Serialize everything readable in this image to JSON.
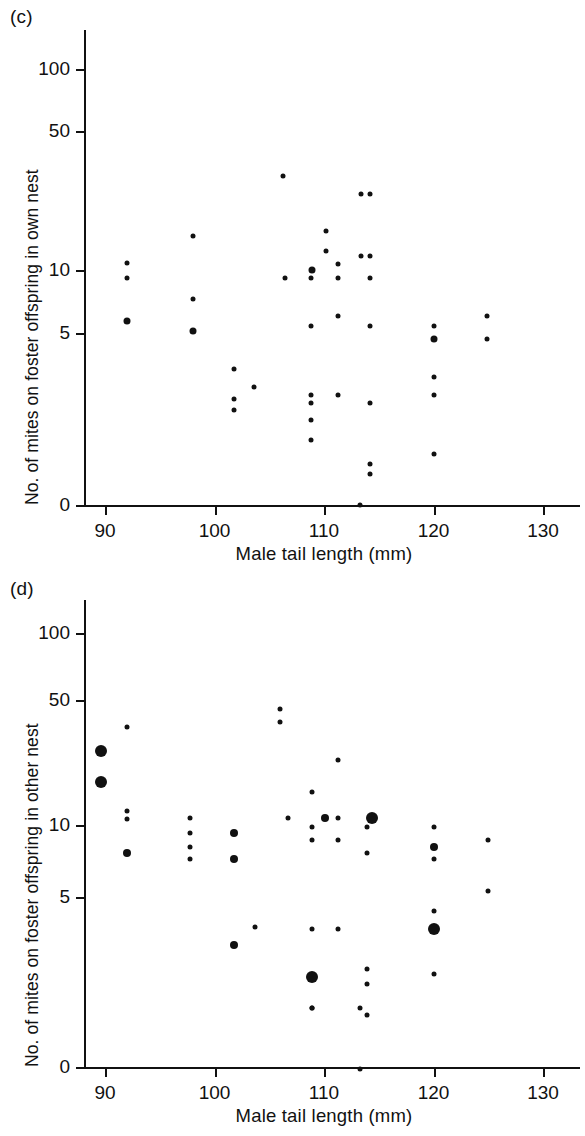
{
  "figure": {
    "background": "#ffffff",
    "ink": "#111111"
  },
  "panels": [
    {
      "id": "c",
      "label": "(c)",
      "xlabel": "Male tail length  (mm)",
      "ylabel": "No. of mites on foster offspring in own nest"
    },
    {
      "id": "d",
      "label": "(d)",
      "xlabel": "Male tail length  (mm)",
      "ylabel": "No. of mites on foster offspring in other nest"
    }
  ],
  "chart_data": [
    {
      "type": "scatter",
      "panel": "(c)",
      "title": "No. of mites on foster offspring in own nest vs male tail length",
      "xlabel": "Male tail length  (mm)",
      "ylabel": "No. of mites on foster offspring in own nest",
      "xlim": [
        88.6,
        131.5
      ],
      "xticks": [
        90,
        100,
        110,
        120,
        130
      ],
      "xticklabels": [
        "90",
        "100",
        "110",
        "120",
        "130"
      ],
      "yscale": "log-with-zero-break",
      "yticks": [
        100,
        50,
        10,
        5,
        0
      ],
      "yticklabels": [
        "100",
        "50",
        "10",
        "5",
        "0"
      ],
      "grid": false,
      "legend": null,
      "marker": "filled circle",
      "marker_sizes_px": {
        "small": 5,
        "medium": 7,
        "large": 9
      },
      "points": [
        {
          "x": 92.0,
          "y": 18,
          "size": "medium"
        },
        {
          "x": 92.0,
          "y": 11,
          "size": "small"
        },
        {
          "x": 92.0,
          "y": 9.2,
          "size": "small"
        },
        {
          "x": 98.0,
          "y": 20,
          "size": "medium"
        },
        {
          "x": 98.0,
          "y": 14,
          "size": "small"
        },
        {
          "x": 98.0,
          "y": 6.8,
          "size": "small"
        },
        {
          "x": 101.8,
          "y": 50,
          "size": "small"
        },
        {
          "x": 101.8,
          "y": 44,
          "size": "small"
        },
        {
          "x": 101.8,
          "y": 31,
          "size": "small"
        },
        {
          "x": 103.6,
          "y": 38,
          "size": "small"
        },
        {
          "x": 106.4,
          "y": 11,
          "size": "small"
        },
        {
          "x": 106.3,
          "y": 3.4,
          "size": "small"
        },
        {
          "x": 108.8,
          "y": 70,
          "size": "small"
        },
        {
          "x": 108.8,
          "y": 56,
          "size": "small"
        },
        {
          "x": 108.8,
          "y": 46,
          "size": "small"
        },
        {
          "x": 108.8,
          "y": 42,
          "size": "small"
        },
        {
          "x": 108.8,
          "y": 19,
          "size": "small"
        },
        {
          "x": 108.8,
          "y": 11,
          "size": "small"
        },
        {
          "x": 108.9,
          "y": 10,
          "size": "medium"
        },
        {
          "x": 110.2,
          "y": 8.0,
          "size": "small"
        },
        {
          "x": 110.2,
          "y": 6.4,
          "size": "small"
        },
        {
          "x": 111.3,
          "y": 42,
          "size": "small"
        },
        {
          "x": 111.3,
          "y": 17,
          "size": "small"
        },
        {
          "x": 111.3,
          "y": 11,
          "size": "small"
        },
        {
          "x": 111.3,
          "y": 9.3,
          "size": "small"
        },
        {
          "x": 113.3,
          "y": 0,
          "size": "small"
        },
        {
          "x": 113.4,
          "y": 8.5,
          "size": "small"
        },
        {
          "x": 113.4,
          "y": 4.2,
          "size": "small"
        },
        {
          "x": 114.2,
          "y": 104,
          "size": "small"
        },
        {
          "x": 114.2,
          "y": 92,
          "size": "small"
        },
        {
          "x": 114.2,
          "y": 46,
          "size": "small"
        },
        {
          "x": 114.2,
          "y": 19,
          "size": "small"
        },
        {
          "x": 114.2,
          "y": 11,
          "size": "small"
        },
        {
          "x": 114.2,
          "y": 8.5,
          "size": "small"
        },
        {
          "x": 114.2,
          "y": 4.2,
          "size": "small"
        },
        {
          "x": 120.0,
          "y": 82,
          "size": "small"
        },
        {
          "x": 120.0,
          "y": 42,
          "size": "small"
        },
        {
          "x": 120.0,
          "y": 34,
          "size": "small"
        },
        {
          "x": 120.0,
          "y": 22,
          "size": "medium"
        },
        {
          "x": 120.0,
          "y": 19,
          "size": "small"
        },
        {
          "x": 124.9,
          "y": 22,
          "size": "small"
        },
        {
          "x": 124.9,
          "y": 17,
          "size": "small"
        }
      ]
    },
    {
      "type": "scatter",
      "panel": "(d)",
      "title": "No. of mites on foster offspring in other nest vs male tail length",
      "xlabel": "Male tail length  (mm)",
      "ylabel": "No. of mites on foster offspring in other nest",
      "xlim": [
        88.6,
        131.5
      ],
      "xticks": [
        90,
        100,
        110,
        120,
        130
      ],
      "xticklabels": [
        "90",
        "100",
        "110",
        "120",
        "130"
      ],
      "yscale": "log-with-zero-break",
      "yticks": [
        100,
        50,
        10,
        5,
        0
      ],
      "yticklabels": [
        "100",
        "50",
        "10",
        "5",
        "0"
      ],
      "grid": false,
      "legend": null,
      "marker": "filled circle",
      "marker_sizes_px": {
        "small": 5,
        "medium": 8,
        "large": 12
      },
      "points": [
        {
          "x": 89.6,
          "y": 4.1,
          "size": "large"
        },
        {
          "x": 89.6,
          "y": 1.7,
          "size": "large"
        },
        {
          "x": 92.0,
          "y": 14,
          "size": "medium"
        },
        {
          "x": 92.0,
          "y": 9.3,
          "size": "small"
        },
        {
          "x": 92.0,
          "y": 8.5,
          "size": "small"
        },
        {
          "x": 92.0,
          "y": 3.1,
          "size": "small"
        },
        {
          "x": 97.8,
          "y": 15,
          "size": "small"
        },
        {
          "x": 97.8,
          "y": 13,
          "size": "small"
        },
        {
          "x": 97.8,
          "y": 11,
          "size": "small"
        },
        {
          "x": 97.8,
          "y": 9.2,
          "size": "small"
        },
        {
          "x": 101.8,
          "y": 42,
          "size": "medium"
        },
        {
          "x": 101.8,
          "y": 15,
          "size": "medium"
        },
        {
          "x": 101.8,
          "y": 11,
          "size": "medium"
        },
        {
          "x": 103.7,
          "y": 34,
          "size": "small"
        },
        {
          "x": 106.0,
          "y": 2.9,
          "size": "small"
        },
        {
          "x": 106.0,
          "y": 2.5,
          "size": "small"
        },
        {
          "x": 106.7,
          "y": 9.2,
          "size": "small"
        },
        {
          "x": 108.9,
          "y": 90,
          "size": "small"
        },
        {
          "x": 108.9,
          "y": 62,
          "size": "large"
        },
        {
          "x": 108.9,
          "y": 35,
          "size": "small"
        },
        {
          "x": 108.9,
          "y": 12,
          "size": "small"
        },
        {
          "x": 108.9,
          "y": 10.3,
          "size": "small"
        },
        {
          "x": 108.9,
          "y": 6.7,
          "size": "small"
        },
        {
          "x": 108.9,
          "y": 0.35,
          "size": "small"
        },
        {
          "x": 110.1,
          "y": 9.2,
          "size": "medium"
        },
        {
          "x": 111.3,
          "y": 35,
          "size": "small"
        },
        {
          "x": 111.3,
          "y": 12,
          "size": "small"
        },
        {
          "x": 111.3,
          "y": 9.2,
          "size": "small"
        },
        {
          "x": 111.3,
          "y": 4.6,
          "size": "small"
        },
        {
          "x": 113.3,
          "y": 0.35,
          "size": "small"
        },
        {
          "x": 113.3,
          "y": -0.2,
          "size": "small"
        },
        {
          "x": 113.9,
          "y": 98,
          "size": "small"
        },
        {
          "x": 113.9,
          "y": 67,
          "size": "small"
        },
        {
          "x": 113.9,
          "y": 56,
          "size": "small"
        },
        {
          "x": 113.9,
          "y": 14,
          "size": "small"
        },
        {
          "x": 113.9,
          "y": 10.2,
          "size": "small"
        },
        {
          "x": 114.4,
          "y": 9.2,
          "size": "large"
        },
        {
          "x": 120.0,
          "y": 60,
          "size": "small"
        },
        {
          "x": 120.0,
          "y": 35,
          "size": "large"
        },
        {
          "x": 120.0,
          "y": 28,
          "size": "small"
        },
        {
          "x": 120.0,
          "y": 15,
          "size": "small"
        },
        {
          "x": 120.0,
          "y": 13,
          "size": "medium"
        },
        {
          "x": 120.0,
          "y": 10.3,
          "size": "small"
        },
        {
          "x": 125.0,
          "y": 22,
          "size": "small"
        },
        {
          "x": 125.0,
          "y": 12,
          "size": "small"
        }
      ]
    }
  ]
}
